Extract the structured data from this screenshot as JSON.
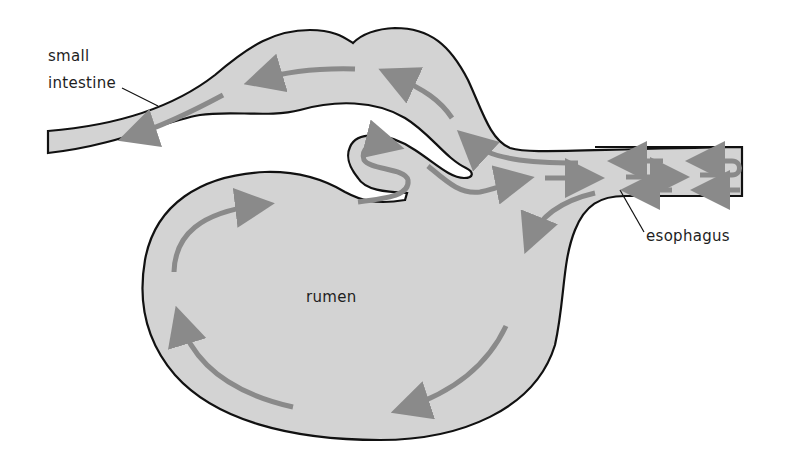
{
  "diagram": {
    "type": "anatomical flow diagram",
    "labels": {
      "small_intestine_line1": "small",
      "small_intestine_line2": "intestine",
      "esophagus": "esophagus",
      "rumen": "rumen"
    },
    "colors": {
      "background": "#ffffff",
      "organ_fill": "#d3d3d3",
      "outline": "#111111",
      "arrow": "#8a8a8a",
      "text": "#1e1e1e"
    },
    "arrows": [
      {
        "region": "esophagus",
        "direction": "left",
        "description": "top lane inflow"
      },
      {
        "region": "esophagus",
        "direction": "right",
        "description": "middle lane outflow (regurgitation)"
      },
      {
        "region": "esophagus",
        "direction": "left",
        "description": "bottom lane inflow"
      },
      {
        "region": "esophagus",
        "direction": "u-turn",
        "description": "end loop"
      },
      {
        "region": "junction",
        "direction": "up-left",
        "description": "toward small intestine"
      },
      {
        "region": "junction",
        "direction": "right",
        "description": "from reticulum to esophagus"
      },
      {
        "region": "junction",
        "direction": "down-left",
        "description": "into rumen"
      },
      {
        "region": "reticulum",
        "direction": "loop",
        "description": "reticulum circulation"
      },
      {
        "region": "upper chamber",
        "direction": "left",
        "description": "toward small intestine"
      },
      {
        "region": "small intestine",
        "direction": "left",
        "description": "exit"
      },
      {
        "region": "rumen",
        "direction": "clockwise",
        "description": "rumen mixing cycle"
      }
    ]
  }
}
